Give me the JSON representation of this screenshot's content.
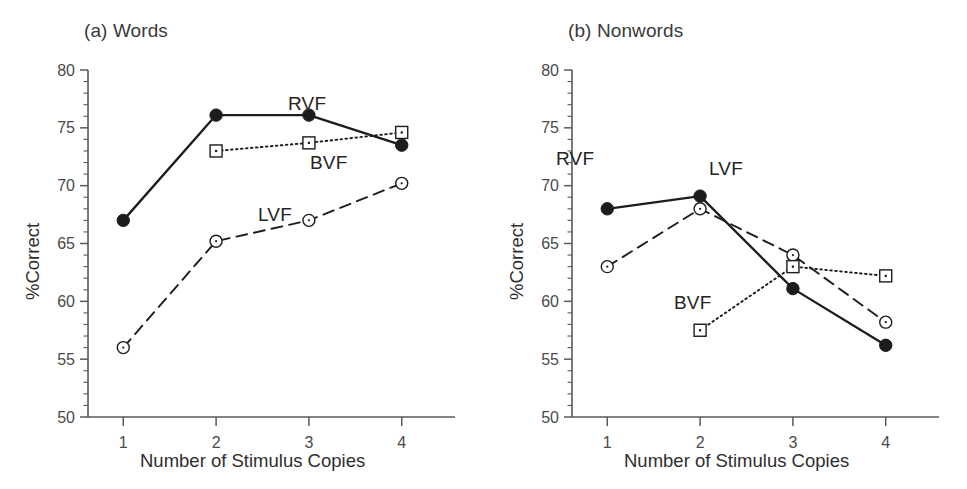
{
  "figure": {
    "axis_color": "#5a5a5a",
    "line_color": "#1c1c1c",
    "marker_fill": "#1c1c1c",
    "marker_open": "#ffffff"
  },
  "chart_data": [
    {
      "type": "line",
      "panel": "a",
      "title": "(a) Words",
      "xlabel": "Number of Stimulus Copies",
      "ylabel": "%Correct",
      "x": [
        1,
        2,
        3,
        4
      ],
      "xticklabels": [
        "1",
        "2",
        "3",
        "4"
      ],
      "yticklabels": [
        "50",
        "55",
        "60",
        "65",
        "70",
        "75",
        "80"
      ],
      "ytickvalues": [
        50,
        55,
        60,
        65,
        70,
        75,
        80
      ],
      "xlim": [
        0.62,
        4.38
      ],
      "ylim": [
        50,
        80
      ],
      "grid": false,
      "legend": "inline-annotations",
      "series": [
        {
          "name": "RVF",
          "values": [
            67.0,
            76.1,
            76.1,
            73.5
          ],
          "marker": "filled-circle",
          "linestyle": "solid",
          "label_x": 288,
          "label_y": 93
        },
        {
          "name": "BVF",
          "values": [
            null,
            73.0,
            73.7,
            74.6
          ],
          "marker": "open-square",
          "linestyle": "dotted",
          "label_x": 310,
          "label_y": 152
        },
        {
          "name": "LVF",
          "values": [
            56.0,
            65.2,
            67.0,
            70.2
          ],
          "marker": "open-circle",
          "linestyle": "dashed",
          "label_x": 258,
          "label_y": 204
        }
      ]
    },
    {
      "type": "line",
      "panel": "b",
      "title": "(b) Nonwords",
      "xlabel": "Number of Stimulus Copies",
      "ylabel": "%Correct",
      "x": [
        1,
        2,
        3,
        4
      ],
      "xticklabels": [
        "1",
        "2",
        "3",
        "4"
      ],
      "yticklabels": [
        "50",
        "55",
        "60",
        "65",
        "70",
        "75",
        "80"
      ],
      "ytickvalues": [
        50,
        55,
        60,
        65,
        70,
        75,
        80
      ],
      "xlim": [
        0.62,
        4.38
      ],
      "ylim": [
        50,
        80
      ],
      "grid": false,
      "legend": "inline-annotations",
      "series": [
        {
          "name": "RVF",
          "values": [
            68.0,
            69.1,
            61.1,
            56.2
          ],
          "marker": "filled-circle",
          "linestyle": "solid",
          "label_x": 72,
          "label_y": 148
        },
        {
          "name": "LVF",
          "values": [
            63.0,
            68.0,
            64.0,
            58.2
          ],
          "marker": "open-circle",
          "linestyle": "dashed",
          "label_x": 225,
          "label_y": 158
        },
        {
          "name": "BVF",
          "values": [
            null,
            57.5,
            63.0,
            62.2
          ],
          "marker": "open-square",
          "linestyle": "dotted",
          "label_x": 190,
          "label_y": 292
        }
      ]
    }
  ]
}
